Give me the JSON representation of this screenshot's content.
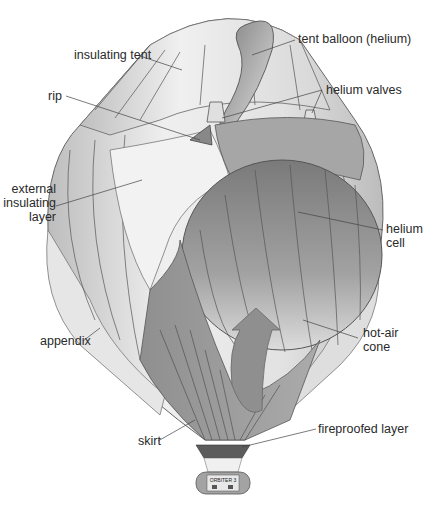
{
  "diagram": {
    "labels": {
      "insulating_tent": "insulating tent",
      "tent_balloon": "tent balloon (helium)",
      "rip": "rip",
      "helium_valves": "helium valves",
      "external_insulating_layer_1": "external",
      "external_insulating_layer_2": "insulating",
      "external_insulating_layer_3": "layer",
      "helium_cell_1": "helium",
      "helium_cell_2": "cell",
      "appendix": "appendix",
      "hot_air_cone_1": "hot-air",
      "hot_air_cone_2": "cone",
      "skirt": "skirt",
      "fireproofed_layer": "fireproofed layer"
    },
    "gondola_text": "ORBITER 3",
    "colors": {
      "outer_light": "#ececec",
      "outer_mid": "#cfcfcf",
      "outer_dark": "#a8a8a8",
      "helium_cell": "#8e8e8e",
      "skirt": "#9a9a9a",
      "fireproof": "#5a5a5a",
      "lines": "#444444"
    }
  }
}
